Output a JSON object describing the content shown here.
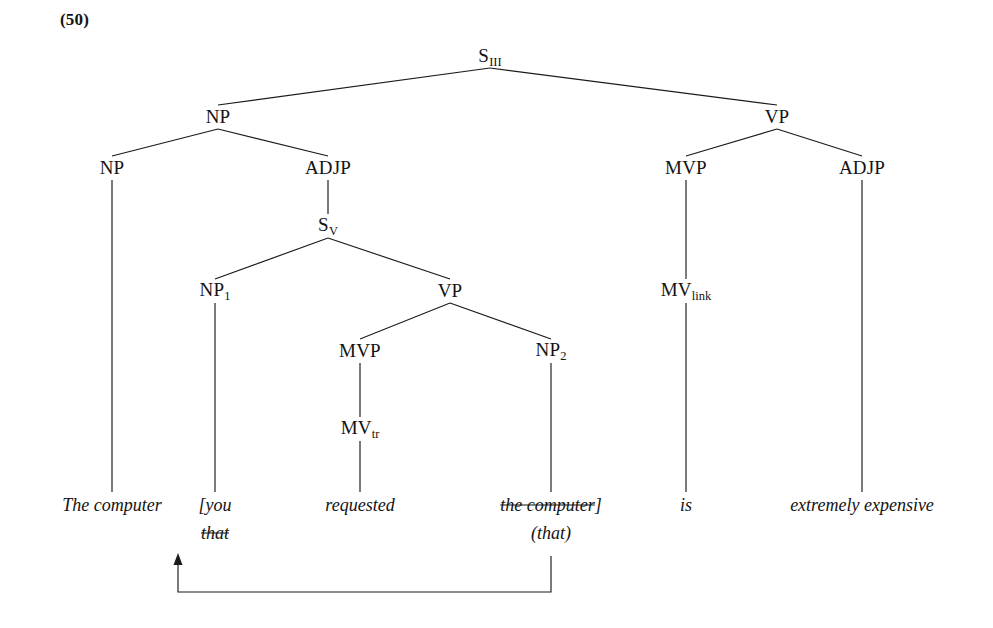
{
  "example_number": "(50)",
  "tree": {
    "nodes": [
      {
        "id": "s3",
        "label": "S",
        "sub": "III",
        "x": 490,
        "y": 57
      },
      {
        "id": "np_top",
        "label": "NP",
        "sub": "",
        "x": 218,
        "y": 117
      },
      {
        "id": "vp_top",
        "label": "VP",
        "sub": "",
        "x": 777,
        "y": 117
      },
      {
        "id": "np_left",
        "label": "NP",
        "sub": "",
        "x": 112,
        "y": 168
      },
      {
        "id": "adjp_l",
        "label": "ADJP",
        "sub": "",
        "x": 328,
        "y": 168
      },
      {
        "id": "mvp_r",
        "label": "MVP",
        "sub": "",
        "x": 686,
        "y": 168
      },
      {
        "id": "adjp_r",
        "label": "ADJP",
        "sub": "",
        "x": 862,
        "y": 168
      },
      {
        "id": "sv",
        "label": "S",
        "sub": "V",
        "x": 328,
        "y": 226
      },
      {
        "id": "np1",
        "label": "NP",
        "sub": "1",
        "x": 215,
        "y": 291
      },
      {
        "id": "vp_mid",
        "label": "VP",
        "sub": "",
        "x": 450,
        "y": 291
      },
      {
        "id": "mvp_mid",
        "label": "MVP",
        "sub": "",
        "x": 360,
        "y": 351
      },
      {
        "id": "np2",
        "label": "NP",
        "sub": "2",
        "x": 551,
        "y": 351
      },
      {
        "id": "mv_link",
        "label": "MV",
        "sub": "link",
        "x": 686,
        "y": 291
      },
      {
        "id": "mv_tr",
        "label": "MV",
        "sub": "tr",
        "x": 360,
        "y": 429
      }
    ],
    "edges": [
      {
        "from": "s3",
        "to": "np_top",
        "x1": 490,
        "y1": 68,
        "x2": 218,
        "y2": 105
      },
      {
        "from": "s3",
        "to": "vp_top",
        "x1": 490,
        "y1": 68,
        "x2": 777,
        "y2": 105
      },
      {
        "from": "np_top",
        "to": "np_left",
        "x1": 218,
        "y1": 129,
        "x2": 112,
        "y2": 156
      },
      {
        "from": "np_top",
        "to": "adjp_l",
        "x1": 218,
        "y1": 129,
        "x2": 328,
        "y2": 156
      },
      {
        "from": "vp_top",
        "to": "mvp_r",
        "x1": 777,
        "y1": 129,
        "x2": 686,
        "y2": 156
      },
      {
        "from": "vp_top",
        "to": "adjp_r",
        "x1": 777,
        "y1": 129,
        "x2": 862,
        "y2": 156
      },
      {
        "from": "adjp_l",
        "to": "sv",
        "x1": 328,
        "y1": 180,
        "x2": 328,
        "y2": 214
      },
      {
        "from": "sv",
        "to": "np1",
        "x1": 328,
        "y1": 238,
        "x2": 215,
        "y2": 279
      },
      {
        "from": "sv",
        "to": "vp_mid",
        "x1": 328,
        "y1": 238,
        "x2": 450,
        "y2": 279
      },
      {
        "from": "vp_mid",
        "to": "mvp_mid",
        "x1": 450,
        "y1": 303,
        "x2": 360,
        "y2": 339
      },
      {
        "from": "vp_mid",
        "to": "np2",
        "x1": 450,
        "y1": 303,
        "x2": 551,
        "y2": 339
      },
      {
        "from": "mvp_mid",
        "to": "mv_tr",
        "x1": 360,
        "y1": 363,
        "x2": 360,
        "y2": 417
      },
      {
        "from": "mvp_r",
        "to": "mv_link",
        "x1": 686,
        "y1": 180,
        "x2": 686,
        "y2": 279
      },
      {
        "from": "np_left",
        "to": "t_the_computer",
        "x1": 112,
        "y1": 180,
        "x2": 112,
        "y2": 492
      },
      {
        "from": "np1",
        "to": "t_you",
        "x1": 215,
        "y1": 303,
        "x2": 215,
        "y2": 492
      },
      {
        "from": "mv_tr",
        "to": "t_requested",
        "x1": 360,
        "y1": 441,
        "x2": 360,
        "y2": 492
      },
      {
        "from": "np2",
        "to": "t_the_comp_2",
        "x1": 551,
        "y1": 363,
        "x2": 551,
        "y2": 492
      },
      {
        "from": "mv_link",
        "to": "t_is",
        "x1": 686,
        "y1": 303,
        "x2": 686,
        "y2": 492
      },
      {
        "from": "adjp_r",
        "to": "t_extremely",
        "x1": 862,
        "y1": 180,
        "x2": 862,
        "y2": 492
      }
    ],
    "terminals": [
      {
        "id": "t_the_computer",
        "text": "The computer",
        "struck": false,
        "bracket": "",
        "x": 112,
        "y": 505
      },
      {
        "id": "t_you",
        "text": "[you",
        "struck": false,
        "bracket": "",
        "x": 215,
        "y": 505
      },
      {
        "id": "t_requested",
        "text": "requested",
        "struck": false,
        "bracket": "",
        "x": 360,
        "y": 505
      },
      {
        "id": "t_the_comp_2",
        "text": "the computer",
        "struck": true,
        "bracket": "]",
        "x": 551,
        "y": 505
      },
      {
        "id": "t_is",
        "text": "is",
        "struck": false,
        "bracket": "",
        "x": 686,
        "y": 505
      },
      {
        "id": "t_extremely",
        "text": "extremely expensive",
        "struck": false,
        "bracket": "",
        "x": 862,
        "y": 505
      }
    ],
    "second_row": [
      {
        "id": "t_that_struck",
        "text": "that",
        "struck": true,
        "x": 215,
        "y": 533
      },
      {
        "id": "t_that_paren",
        "text": "(that)",
        "struck": false,
        "x": 551,
        "y": 533
      }
    ]
  },
  "movement_arrow": {
    "label": "movement-arrow",
    "source_x": 551,
    "source_y": 556,
    "baseline_y": 592,
    "target_x": 178,
    "target_y": 553
  },
  "colors": {
    "ink": "#131313",
    "line": "#1a1a1a",
    "background": "#ffffff"
  }
}
